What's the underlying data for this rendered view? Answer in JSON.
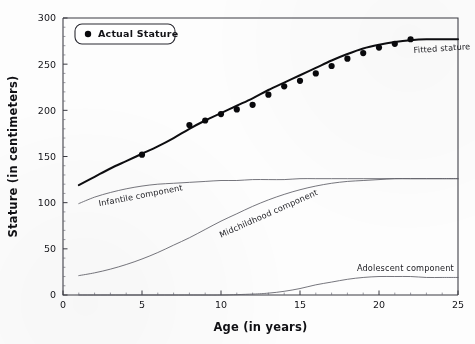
{
  "chart_data": {
    "type": "scatter",
    "title": "",
    "xlabel": "Age (in years)",
    "ylabel": "Stature (in centimeters)",
    "xlim": [
      0,
      25
    ],
    "ylim": [
      0,
      300
    ],
    "xticks": [
      0,
      5,
      10,
      15,
      20,
      25
    ],
    "yticks": [
      0,
      50,
      100,
      150,
      200,
      250,
      300
    ],
    "xtick_labels": [
      "0",
      "5",
      "10",
      "15",
      "20",
      "25"
    ],
    "ytick_labels": [
      "0",
      "50",
      "100",
      "150",
      "200",
      "250",
      "300"
    ],
    "grid": false,
    "legend": {
      "position": "top-left",
      "entries": [
        {
          "label": "Actual Stature",
          "marker": "filled-circle",
          "color": "#09090c"
        }
      ]
    },
    "annotations": [
      {
        "text": "Fitted stature",
        "x": 22.2,
        "y": 262,
        "rotation": -4
      },
      {
        "text": "Infantile component",
        "x": 2.3,
        "y": 96,
        "rotation": -11
      },
      {
        "text": "Midchildhood component",
        "x": 10.0,
        "y": 62,
        "rotation": -24
      },
      {
        "text": "Adolescent component",
        "x": 18.6,
        "y": 26,
        "rotation": 0
      }
    ],
    "series": [
      {
        "name": "Actual Stature",
        "type": "scatter",
        "marker": "filled-circle",
        "color": "#09090c",
        "x": [
          5,
          8,
          9,
          10,
          11,
          12,
          13,
          14,
          15,
          16,
          17,
          18,
          19,
          20,
          21,
          22
        ],
        "y": [
          152,
          184,
          189,
          196,
          201,
          206,
          217,
          226,
          232,
          240,
          248,
          256,
          262,
          268,
          272,
          277
        ]
      },
      {
        "name": "Fitted stature",
        "type": "line",
        "color": "#0d0d10",
        "x": [
          1,
          2,
          3,
          4,
          5,
          6,
          7,
          8,
          9,
          10,
          11,
          12,
          13,
          14,
          15,
          16,
          17,
          18,
          19,
          20,
          21,
          22,
          23,
          24,
          25
        ],
        "y": [
          119,
          128,
          137,
          145,
          153,
          161,
          170,
          180,
          189,
          197,
          205,
          213,
          222,
          230,
          238,
          246,
          254,
          261,
          267,
          271,
          274,
          276,
          277,
          277,
          277
        ]
      },
      {
        "name": "Infantile component",
        "type": "line",
        "color": "#5d5d66",
        "x": [
          1,
          2,
          3,
          4,
          5,
          6,
          7,
          8,
          9,
          10,
          11,
          12,
          13,
          14,
          15,
          16,
          17,
          18,
          19,
          20,
          21,
          22,
          23,
          24,
          25
        ],
        "y": [
          99,
          106,
          111,
          115,
          118,
          120,
          121,
          122,
          123,
          124,
          124,
          125,
          125,
          125,
          126,
          126,
          126,
          126,
          126,
          126,
          126,
          126,
          126,
          126,
          126
        ]
      },
      {
        "name": "Midchildhood component",
        "type": "line",
        "color": "#5d5d66",
        "x": [
          1,
          2,
          3,
          4,
          5,
          6,
          7,
          8,
          9,
          10,
          11,
          12,
          13,
          14,
          15,
          16,
          17,
          18,
          19,
          20,
          21,
          22,
          23,
          24,
          25
        ],
        "y": [
          21,
          24,
          28,
          33,
          39,
          46,
          54,
          62,
          71,
          80,
          88,
          96,
          103,
          109,
          114,
          118,
          121,
          123,
          124,
          125,
          126,
          126,
          126,
          126,
          126
        ]
      },
      {
        "name": "Adolescent component",
        "type": "line",
        "color": "#5d5d66",
        "x": [
          1,
          8,
          10,
          12,
          13,
          14,
          15,
          16,
          17,
          18,
          19,
          20,
          21,
          22,
          23,
          24,
          25
        ],
        "y": [
          0,
          0,
          0,
          1,
          2,
          4,
          7,
          11,
          14,
          17,
          19,
          20,
          20,
          20,
          19,
          19,
          19
        ]
      }
    ]
  }
}
